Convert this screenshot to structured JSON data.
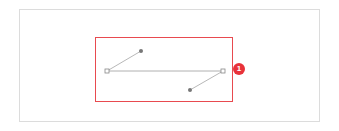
{
  "diagram": {
    "type": "bezier-curve-handles",
    "highlight_color": "#e84a4f",
    "badge": {
      "label": "1",
      "color": "#e8323a"
    },
    "anchors": [
      {
        "name": "left-anchor",
        "x": 107,
        "y": 71
      },
      {
        "name": "right-anchor",
        "x": 223,
        "y": 71
      }
    ],
    "handles": [
      {
        "name": "left-handle",
        "x": 141,
        "y": 51
      },
      {
        "name": "right-handle",
        "x": 190,
        "y": 90
      }
    ]
  }
}
